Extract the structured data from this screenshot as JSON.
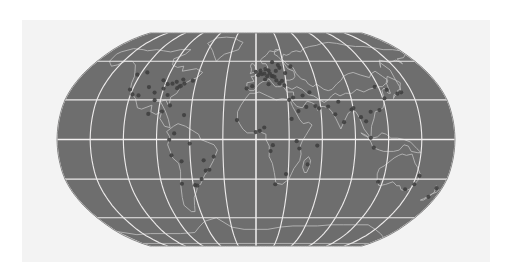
{
  "figure": {
    "projection": "Robinson",
    "panel_color": "#f3f3f3",
    "background_color": "#ffffff",
    "ocean_color": "#6e6e6e",
    "land_color": "#6d6d6d",
    "coastline_color": "#bdbdbd",
    "graticule_color": "#ececec",
    "marker_color": "#3f3f3f"
  },
  "map": {
    "bounds": {
      "left": 57,
      "top": 33,
      "right": 455,
      "bottom": 246
    },
    "graticule": {
      "meridian_interval_deg": 30,
      "parallel_interval_deg": 30,
      "meridians_deg": [
        -180,
        -150,
        -120,
        -90,
        -60,
        -30,
        0,
        30,
        60,
        90,
        120,
        150,
        180
      ],
      "parallels_deg": [
        -60,
        -30,
        0,
        30,
        60
      ],
      "equator_deg": 0,
      "visible": true
    },
    "land_regions": [
      "north-america",
      "south-america",
      "greenland",
      "europe",
      "africa",
      "asia",
      "australia",
      "antarctica",
      "madagascar",
      "new-zealand",
      "japan",
      "british-isles",
      "indonesia"
    ],
    "markers": {
      "shape": "circle",
      "count": 96,
      "densest_region": "europe",
      "points": [
        [
          -122.4,
          37.8
        ],
        [
          -118.2,
          34.1
        ],
        [
          -112.1,
          33.4
        ],
        [
          -104.9,
          39.7
        ],
        [
          -97.5,
          35.5
        ],
        [
          -95.4,
          29.8
        ],
        [
          -93.3,
          44.9
        ],
        [
          -90.2,
          38.6
        ],
        [
          -87.6,
          41.9
        ],
        [
          -84.4,
          33.7
        ],
        [
          -83.0,
          42.3
        ],
        [
          -80.2,
          25.8
        ],
        [
          -79.4,
          43.7
        ],
        [
          -77.0,
          38.9
        ],
        [
          -75.2,
          40.0
        ],
        [
          -73.9,
          40.7
        ],
        [
          -71.1,
          42.4
        ],
        [
          -63.6,
          44.6
        ],
        [
          -123.1,
          49.3
        ],
        [
          -114.1,
          51.0
        ],
        [
          -73.6,
          45.5
        ],
        [
          -99.1,
          19.4
        ],
        [
          -86.8,
          21.2
        ],
        [
          -66.1,
          18.5
        ],
        [
          -74.1,
          4.6
        ],
        [
          -78.5,
          -0.2
        ],
        [
          -77.0,
          -12.0
        ],
        [
          -70.7,
          -33.5
        ],
        [
          -58.4,
          -34.6
        ],
        [
          -56.2,
          -34.9
        ],
        [
          -47.9,
          -15.8
        ],
        [
          -46.6,
          -23.6
        ],
        [
          -43.2,
          -22.9
        ],
        [
          -38.5,
          -12.9
        ],
        [
          -60.0,
          -3.1
        ],
        [
          -68.2,
          -16.5
        ],
        [
          -51.2,
          -30.0
        ],
        [
          -9.1,
          38.7
        ],
        [
          -3.7,
          40.4
        ],
        [
          -0.1,
          51.5
        ],
        [
          2.3,
          48.9
        ],
        [
          4.9,
          52.4
        ],
        [
          4.4,
          50.8
        ],
        [
          6.1,
          49.6
        ],
        [
          8.7,
          50.1
        ],
        [
          9.2,
          45.5
        ],
        [
          10.0,
          53.6
        ],
        [
          11.6,
          48.1
        ],
        [
          12.5,
          41.9
        ],
        [
          13.4,
          52.5
        ],
        [
          14.4,
          50.1
        ],
        [
          16.4,
          48.2
        ],
        [
          17.1,
          48.1
        ],
        [
          18.1,
          59.3
        ],
        [
          19.0,
          47.5
        ],
        [
          20.5,
          44.8
        ],
        [
          21.0,
          52.2
        ],
        [
          23.3,
          42.7
        ],
        [
          24.1,
          56.9
        ],
        [
          25.3,
          54.7
        ],
        [
          26.1,
          44.4
        ],
        [
          28.0,
          41.0
        ],
        [
          30.5,
          50.5
        ],
        [
          31.2,
          30.0
        ],
        [
          35.2,
          31.8
        ],
        [
          37.6,
          55.8
        ],
        [
          39.2,
          21.5
        ],
        [
          44.4,
          33.3
        ],
        [
          46.7,
          24.7
        ],
        [
          51.4,
          35.7
        ],
        [
          55.3,
          25.3
        ],
        [
          58.4,
          23.6
        ],
        [
          67.0,
          24.9
        ],
        [
          72.9,
          19.1
        ],
        [
          77.2,
          28.6
        ],
        [
          80.3,
          13.1
        ],
        [
          88.4,
          22.6
        ],
        [
          90.4,
          23.8
        ],
        [
          96.2,
          16.9
        ],
        [
          100.5,
          13.8
        ],
        [
          103.9,
          1.3
        ],
        [
          106.8,
          -6.2
        ],
        [
          105.8,
          21.0
        ],
        [
          114.2,
          22.3
        ],
        [
          116.4,
          39.9
        ],
        [
          121.5,
          31.2
        ],
        [
          126.9,
          37.6
        ],
        [
          135.5,
          34.7
        ],
        [
          139.7,
          35.7
        ],
        [
          3.4,
          6.5
        ],
        [
          7.5,
          9.1
        ],
        [
          -17.4,
          14.7
        ],
        [
          -0.2,
          5.6
        ],
        [
          18.4,
          -33.9
        ],
        [
          28.0,
          -26.2
        ],
        [
          36.8,
          -1.3
        ],
        [
          39.3,
          -6.8
        ],
        [
          32.6,
          15.6
        ],
        [
          15.3,
          -4.3
        ],
        [
          13.2,
          -8.8
        ],
        [
          47.5,
          -18.9
        ],
        [
          55.5,
          -4.6
        ],
        [
          144.9,
          -37.8
        ],
        [
          151.2,
          -33.9
        ],
        [
          153.0,
          -27.5
        ],
        [
          115.9,
          -32.0
        ],
        [
          174.8,
          -36.9
        ],
        [
          172.6,
          -43.5
        ]
      ]
    }
  }
}
